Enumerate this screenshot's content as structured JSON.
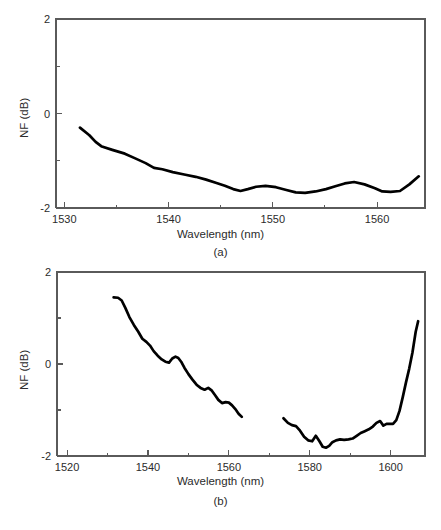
{
  "figure": {
    "caption_a": "(a)",
    "caption_b": "(b)",
    "footer_text": ""
  },
  "colors": {
    "curve": "#000000",
    "axis": "#5a5a5a",
    "text": "#2b2b2b",
    "background": "#ffffff"
  },
  "chart_data": [
    {
      "type": "line",
      "panel": "(a)",
      "title": "",
      "xlabel": "Wavelength (nm)",
      "ylabel": "NF (dB)",
      "xlim": [
        1529.2,
        1564.6
      ],
      "ylim": [
        -2,
        2
      ],
      "xticks": [
        1530,
        1540,
        1550,
        1560
      ],
      "xticklabels": [
        "1530",
        "1540",
        "1550",
        "1560"
      ],
      "xminorticks": [
        1535,
        1545,
        1555
      ],
      "yticks": [
        -2,
        0,
        2
      ],
      "yticklabels": [
        "-2",
        "0",
        "2"
      ],
      "yminorticks": [
        -1,
        1
      ],
      "grid": false,
      "legend": false,
      "series": [
        {
          "name": "NF",
          "x": [
            1531.5,
            1532.4,
            1533.0,
            1533.6,
            1534.6,
            1535.8,
            1536.8,
            1537.8,
            1538.6,
            1539.4,
            1540.4,
            1541.5,
            1542.6,
            1543.6,
            1544.6,
            1545.4,
            1546.2,
            1546.9,
            1547.6,
            1548.4,
            1549.3,
            1550.3,
            1551.3,
            1552.2,
            1553.1,
            1554.1,
            1555.1,
            1556.0,
            1556.9,
            1557.8,
            1558.8,
            1559.8,
            1560.5,
            1561.3,
            1562.2,
            1563.1,
            1564.0
          ],
          "y": [
            -0.3,
            -0.46,
            -0.6,
            -0.7,
            -0.77,
            -0.85,
            -0.95,
            -1.05,
            -1.15,
            -1.18,
            -1.24,
            -1.29,
            -1.34,
            -1.4,
            -1.47,
            -1.53,
            -1.6,
            -1.64,
            -1.6,
            -1.55,
            -1.53,
            -1.56,
            -1.62,
            -1.67,
            -1.68,
            -1.65,
            -1.6,
            -1.54,
            -1.48,
            -1.45,
            -1.5,
            -1.58,
            -1.65,
            -1.66,
            -1.64,
            -1.5,
            -1.33
          ]
        }
      ]
    },
    {
      "type": "line",
      "panel": "(b)",
      "title": "",
      "xlabel": "Wavelength (nm)",
      "ylabel": "NF (dB)",
      "xlim": [
        1517.5,
        1608.5
      ],
      "ylim": [
        -2,
        2
      ],
      "xticks": [
        1520,
        1540,
        1560,
        1580,
        1600
      ],
      "xticklabels": [
        "1520",
        "1540",
        "1560",
        "1580",
        "1600"
      ],
      "xminorticks": [
        1530,
        1550,
        1570,
        1590
      ],
      "yticks": [
        -2,
        0,
        2
      ],
      "yticklabels": [
        "-2",
        "0",
        "2"
      ],
      "yminorticks": [
        -1,
        1
      ],
      "grid": false,
      "legend": false,
      "series": [
        {
          "name": "NF C-band segment",
          "x": [
            1531.5,
            1532.6,
            1533.5,
            1534.4,
            1535.4,
            1536.5,
            1537.6,
            1538.6,
            1539.6,
            1540.5,
            1541.4,
            1542.4,
            1543.4,
            1544.3,
            1545.2,
            1546.0,
            1546.8,
            1547.5,
            1548.2,
            1549.0,
            1550.0,
            1551.0,
            1552.0,
            1553.0,
            1554.0,
            1554.9,
            1555.8,
            1556.6,
            1557.4,
            1558.3,
            1559.2,
            1560.0,
            1560.8,
            1561.6,
            1562.4,
            1563.2
          ],
          "y": [
            1.45,
            1.44,
            1.38,
            1.22,
            1.02,
            0.85,
            0.7,
            0.55,
            0.48,
            0.4,
            0.28,
            0.18,
            0.1,
            0.05,
            0.03,
            0.12,
            0.16,
            0.13,
            0.05,
            -0.08,
            -0.22,
            -0.34,
            -0.45,
            -0.52,
            -0.56,
            -0.52,
            -0.58,
            -0.68,
            -0.78,
            -0.85,
            -0.83,
            -0.84,
            -0.9,
            -0.98,
            -1.08,
            -1.15
          ]
        },
        {
          "name": "NF L-band segment",
          "x": [
            1573.5,
            1574.6,
            1575.6,
            1576.6,
            1577.6,
            1578.6,
            1579.6,
            1580.6,
            1581.5,
            1582.4,
            1583.2,
            1584.0,
            1584.8,
            1585.6,
            1586.5,
            1587.5,
            1588.5,
            1589.6,
            1590.6,
            1591.6,
            1592.6,
            1593.6,
            1594.6,
            1595.6,
            1596.5,
            1597.4,
            1598.2,
            1599.0,
            1599.8,
            1600.6,
            1601.4,
            1602.2,
            1603.0,
            1603.8,
            1604.6,
            1605.4,
            1606.2,
            1606.8
          ],
          "y": [
            -1.18,
            -1.28,
            -1.33,
            -1.35,
            -1.45,
            -1.58,
            -1.66,
            -1.68,
            -1.56,
            -1.68,
            -1.8,
            -1.82,
            -1.78,
            -1.7,
            -1.66,
            -1.64,
            -1.65,
            -1.64,
            -1.62,
            -1.56,
            -1.5,
            -1.46,
            -1.42,
            -1.36,
            -1.28,
            -1.24,
            -1.34,
            -1.3,
            -1.3,
            -1.3,
            -1.22,
            -1.02,
            -0.72,
            -0.4,
            -0.1,
            0.25,
            0.7,
            0.93
          ]
        }
      ]
    }
  ]
}
